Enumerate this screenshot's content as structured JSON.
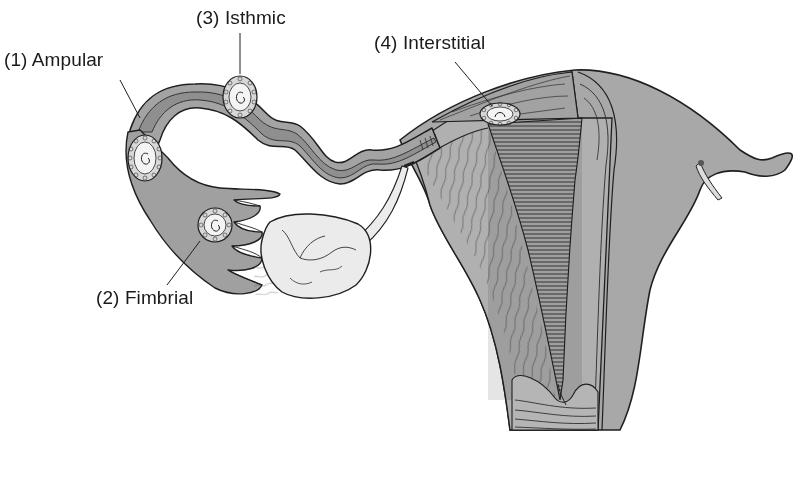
{
  "figure": {
    "colors": {
      "background": "#ffffff",
      "tissue": "#a6a6a6",
      "tissue_dark": "#8f8f8f",
      "lumen": "#959595",
      "ovary": "#e9e9e9",
      "sac": "#f2f2f2",
      "ink": "#1f1f1f"
    }
  },
  "labels": [
    {
      "id": "ampular",
      "number": "(1)",
      "text": "(1) Ampular",
      "x": 4,
      "y": 56,
      "pointer": {
        "x1": 120,
        "y1": 80,
        "x2": 140,
        "y2": 118
      }
    },
    {
      "id": "fimbrial",
      "number": "(2)",
      "text": "(2) Fimbrial",
      "x": 96,
      "y": 289,
      "pointer": {
        "x1": 167,
        "y1": 285,
        "x2": 200,
        "y2": 241
      }
    },
    {
      "id": "isthmic",
      "number": "(3)",
      "text": "(3) Isthmic",
      "x": 196,
      "y": 8,
      "pointer": {
        "x1": 240,
        "y1": 33,
        "x2": 240,
        "y2": 72
      }
    },
    {
      "id": "interstitial",
      "number": "(4)",
      "text": "(4) Interstitial",
      "x": 374,
      "y": 33,
      "pointer": {
        "x1": 455,
        "y1": 62,
        "x2": 490,
        "y2": 104
      }
    }
  ],
  "structures": [
    {
      "id": "fallopian-tube",
      "name": "Fallopian tube"
    },
    {
      "id": "fimbriae",
      "name": "Fimbriae"
    },
    {
      "id": "ovary",
      "name": "Ovary"
    },
    {
      "id": "ovarian-ligament",
      "name": "Ovarian ligament"
    },
    {
      "id": "uterus",
      "name": "Uterus (cut section)"
    },
    {
      "id": "endometrial-cavity",
      "name": "Endometrial cavity"
    },
    {
      "id": "cervix",
      "name": "Cervix"
    },
    {
      "id": "round-ligament",
      "name": "Round ligament"
    }
  ]
}
